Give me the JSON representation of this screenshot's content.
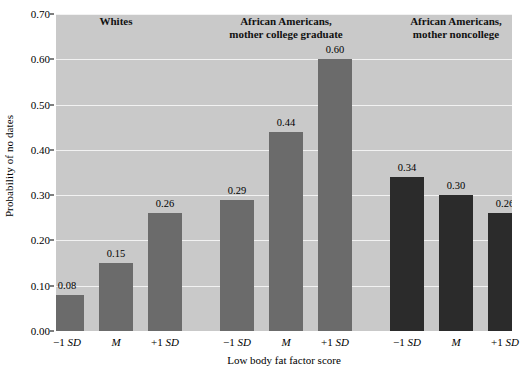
{
  "chart_data": {
    "type": "bar",
    "title": "",
    "xlabel": "Low body fat factor score",
    "ylabel": "Probability of no dates",
    "ylim": [
      0.0,
      0.7
    ],
    "ytick_labels": [
      "0.00",
      "0.10",
      "0.20",
      "0.30",
      "0.40",
      "0.50",
      "0.60",
      "0.70"
    ],
    "ytick_values": [
      0.0,
      0.1,
      0.2,
      0.3,
      0.4,
      0.5,
      0.6,
      0.7
    ],
    "grid": "horizontal",
    "legend": "none",
    "categories": [
      "-1 SD",
      "M",
      "+1 SD"
    ],
    "groups": [
      {
        "name": "Whites",
        "header_lines": [
          "Whites"
        ],
        "color": "#6b6b6b",
        "bars": [
          {
            "category_prefix": "−1",
            "category_italic": "SD",
            "label": "0.08",
            "value": 0.08
          },
          {
            "category_prefix": "",
            "category_italic": "M",
            "label": "0.15",
            "value": 0.15
          },
          {
            "category_prefix": "+1",
            "category_italic": "SD",
            "label": "0.26",
            "value": 0.26
          }
        ]
      },
      {
        "name": "African Americans, mother college graduate",
        "header_lines": [
          "African Americans,",
          "mother college graduate"
        ],
        "color": "#6b6b6b",
        "bars": [
          {
            "category_prefix": "−1",
            "category_italic": "SD",
            "label": "0.29",
            "value": 0.29
          },
          {
            "category_prefix": "",
            "category_italic": "M",
            "label": "0.44",
            "value": 0.44
          },
          {
            "category_prefix": "+1",
            "category_italic": "SD",
            "label": "0.60",
            "value": 0.6
          }
        ]
      },
      {
        "name": "African Americans, mother noncollege",
        "header_lines": [
          "African Americans,",
          "mother noncollege"
        ],
        "color": "#2b2b2b",
        "bars": [
          {
            "category_prefix": "−1",
            "category_italic": "SD",
            "label": "0.34",
            "value": 0.34
          },
          {
            "category_prefix": "",
            "category_italic": "M",
            "label": "0.30",
            "value": 0.3
          },
          {
            "category_prefix": "+1",
            "category_italic": "SD",
            "label": "0.26",
            "value": 0.26
          }
        ]
      }
    ],
    "plot_background_color": "#c9c9c9",
    "gridline_color": "#f2f2f2"
  }
}
